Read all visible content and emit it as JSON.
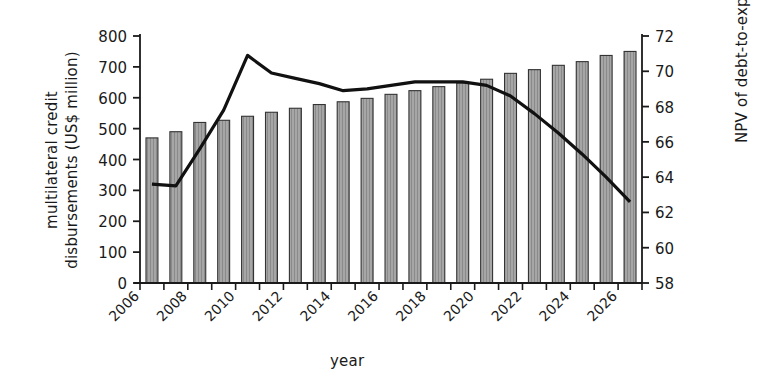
{
  "chart_data": {
    "type": "bar",
    "title": "",
    "xlabel": "year",
    "ylabel": "multilateral credit disbursements (US$ million)",
    "y2label": "NPV of debt-to-export ratio",
    "ylim": [
      0,
      800
    ],
    "y2lim": [
      58,
      72
    ],
    "yticks": [
      0,
      100,
      200,
      300,
      400,
      500,
      600,
      700,
      800
    ],
    "y2ticks": [
      58,
      60,
      62,
      64,
      66,
      68,
      70,
      72
    ],
    "xlim": [
      2006,
      2027
    ],
    "xticks": [
      2006,
      2007,
      2008,
      2009,
      2010,
      2011,
      2012,
      2013,
      2014,
      2015,
      2016,
      2017,
      2018,
      2019,
      2020,
      2021,
      2022,
      2023,
      2024,
      2025,
      2026,
      2027
    ],
    "xticklabels": [
      "2006",
      "2008",
      "2010",
      "2012",
      "2014",
      "2016",
      "2018",
      "2020",
      "2022",
      "2024",
      "2026"
    ],
    "xticklabel_values": [
      2006,
      2008,
      2010,
      2012,
      2014,
      2016,
      2018,
      2020,
      2022,
      2024,
      2026
    ],
    "grid": false,
    "legend": "none",
    "categories": [
      2007,
      2008,
      2009,
      2010,
      2011,
      2012,
      2013,
      2014,
      2015,
      2016,
      2017,
      2018,
      2019,
      2020,
      2021,
      2022,
      2023,
      2024,
      2025,
      2026,
      2027
    ],
    "series": [
      {
        "name": "multilateral credit disbursements (US$ million)",
        "type": "bar",
        "axis": "left",
        "color": "#9a9a9a",
        "edge_color": "#333333",
        "hatch": "vertical-dotted",
        "values": [
          470,
          490,
          520,
          527,
          540,
          553,
          566,
          578,
          587,
          598,
          611,
          623,
          636,
          648,
          660,
          679,
          691,
          705,
          717,
          737,
          750
        ]
      },
      {
        "name": "NPV of debt-to-export ratio",
        "type": "line",
        "axis": "right",
        "color": "#111111",
        "x": [
          2007,
          2008,
          2009,
          2010,
          2011,
          2012,
          2013,
          2014,
          2015,
          2016,
          2017,
          2018,
          2019,
          2020,
          2021,
          2022,
          2023,
          2024,
          2025,
          2026,
          2027
        ],
        "values": [
          63.6,
          63.5,
          65.6,
          67.8,
          70.9,
          69.9,
          69.6,
          69.3,
          68.9,
          69.0,
          69.2,
          69.4,
          69.4,
          69.4,
          69.2,
          68.6,
          67.6,
          66.5,
          65.3,
          64.0,
          62.6
        ]
      }
    ]
  }
}
